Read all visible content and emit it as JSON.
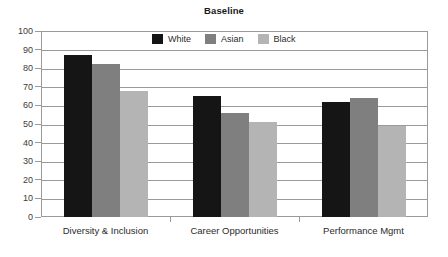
{
  "chart_data": {
    "type": "bar",
    "title": "Baseline",
    "xlabel": "",
    "ylabel": "",
    "ylim": [
      0,
      100
    ],
    "yticks": [
      0,
      10,
      20,
      30,
      40,
      50,
      60,
      70,
      80,
      90,
      100
    ],
    "grid": true,
    "legend_position": "top-center-inside",
    "categories": [
      "Diversity & Inclusion",
      "Career Opportunities",
      "Performance Mgmt"
    ],
    "series": [
      {
        "name": "White",
        "color": "#151515",
        "values": [
          87,
          65,
          62
        ]
      },
      {
        "name": "Asian",
        "color": "#7f7f7f",
        "values": [
          82,
          56,
          64
        ]
      },
      {
        "name": "Black",
        "color": "#b4b4b4",
        "values": [
          68,
          51,
          49
        ]
      }
    ]
  },
  "axis": {
    "y_tick_labels": [
      "100",
      "90",
      "80",
      "70",
      "60",
      "50",
      "40",
      "30",
      "20",
      "10",
      "0"
    ]
  },
  "legend": {
    "items": [
      {
        "label": "White"
      },
      {
        "label": "Asian"
      },
      {
        "label": "Black"
      }
    ]
  }
}
